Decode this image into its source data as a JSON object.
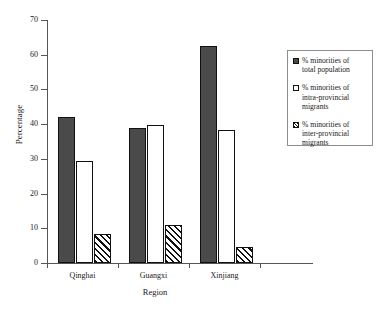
{
  "chart_data": {
    "type": "bar",
    "title": "",
    "xlabel": "Region",
    "ylabel": "Percentage",
    "categories": [
      "Qinghai",
      "Guangxi",
      "Xinjiang"
    ],
    "ylim": [
      0,
      70
    ],
    "yticks": [
      0,
      10,
      20,
      30,
      40,
      50,
      60,
      70
    ],
    "grid": false,
    "legend_position": "right",
    "series": [
      {
        "name": "% minorities  of\ntotal population",
        "style": "solid-dark",
        "color": "#4a4a4a",
        "values": [
          42,
          39,
          62.5
        ]
      },
      {
        "name": "% minorities of\nintra-provincial\nmigrants",
        "style": "open-white",
        "color": "#ffffff",
        "values": [
          29.5,
          39.7,
          38.3
        ]
      },
      {
        "name": "% minorities of\ninter-provincial\nmigrants",
        "style": "hatched",
        "color": "#ffffff",
        "values": [
          8.4,
          11,
          4.6
        ]
      }
    ]
  },
  "axes": {
    "y_title": "Percentage",
    "x_title": "Region",
    "y_tick_labels": [
      "0",
      "10",
      "20",
      "30",
      "40",
      "50",
      "60",
      "70"
    ],
    "x_tick_labels": [
      "Qinghai",
      "Guangxi",
      "Xinjiang"
    ]
  },
  "legend": {
    "entries": [
      {
        "label": "% minorities  of\ntotal population"
      },
      {
        "label": "% minorities of\nintra-provincial\nmigrants"
      },
      {
        "label": "% minorities of\ninter-provincial\nmigrants"
      }
    ]
  }
}
